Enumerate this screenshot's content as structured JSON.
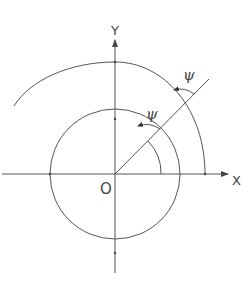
{
  "diagram": {
    "axes": {
      "x_label": "X",
      "y_label": "Y",
      "origin_label": "O"
    },
    "angle_labels": {
      "inner": "ψ",
      "outer": "ψ"
    },
    "colors": {
      "line": "#555555",
      "text": "#444444",
      "background": "#ffffff"
    }
  }
}
